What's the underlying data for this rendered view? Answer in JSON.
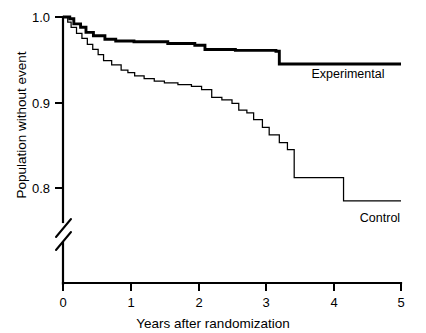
{
  "chart_data": {
    "type": "line",
    "subtype": "kaplan-meier-step",
    "title": "",
    "xlabel": "Years after randomization",
    "ylabel": "Population without event",
    "xlim": [
      0,
      5
    ],
    "ylim": [
      0.78,
      1.0
    ],
    "y_axis_break": true,
    "y_axis_break_note": "axis broken below 0.8",
    "grid": false,
    "legend_position": "inline-right-of-curve",
    "xticks": [
      0,
      1,
      2,
      3,
      4,
      5
    ],
    "xtick_labels": [
      "0",
      "1",
      "2",
      "3",
      "4",
      "5"
    ],
    "yticks": [
      0.8,
      0.9,
      1.0
    ],
    "ytick_labels": [
      "0.8",
      "0.9",
      "1.0"
    ],
    "series": [
      {
        "name": "Experimental",
        "label": "Experimental",
        "style": "bold",
        "points": [
          [
            0.0,
            1.0
          ],
          [
            0.1,
            0.998
          ],
          [
            0.16,
            0.992
          ],
          [
            0.26,
            0.988
          ],
          [
            0.34,
            0.982
          ],
          [
            0.45,
            0.978
          ],
          [
            0.62,
            0.974
          ],
          [
            0.78,
            0.972
          ],
          [
            1.05,
            0.971
          ],
          [
            1.55,
            0.969
          ],
          [
            1.95,
            0.967
          ],
          [
            2.1,
            0.962
          ],
          [
            2.55,
            0.961
          ],
          [
            3.15,
            0.96
          ],
          [
            3.2,
            0.945
          ],
          [
            5.0,
            0.945
          ]
        ]
      },
      {
        "name": "Control",
        "label": "Control",
        "style": "thin",
        "points": [
          [
            0.0,
            1.0
          ],
          [
            0.07,
            0.994
          ],
          [
            0.12,
            0.988
          ],
          [
            0.2,
            0.981
          ],
          [
            0.28,
            0.975
          ],
          [
            0.36,
            0.968
          ],
          [
            0.44,
            0.962
          ],
          [
            0.52,
            0.956
          ],
          [
            0.6,
            0.949
          ],
          [
            0.72,
            0.944
          ],
          [
            0.86,
            0.938
          ],
          [
            0.96,
            0.935
          ],
          [
            1.06,
            0.931
          ],
          [
            1.2,
            0.928
          ],
          [
            1.35,
            0.925
          ],
          [
            1.5,
            0.923
          ],
          [
            1.7,
            0.921
          ],
          [
            1.9,
            0.919
          ],
          [
            2.05,
            0.915
          ],
          [
            2.2,
            0.906
          ],
          [
            2.35,
            0.903
          ],
          [
            2.5,
            0.899
          ],
          [
            2.6,
            0.891
          ],
          [
            2.72,
            0.888
          ],
          [
            2.82,
            0.88
          ],
          [
            2.95,
            0.871
          ],
          [
            3.05,
            0.862
          ],
          [
            3.2,
            0.853
          ],
          [
            3.32,
            0.845
          ],
          [
            3.42,
            0.812
          ],
          [
            4.1,
            0.812
          ],
          [
            4.15,
            0.785
          ],
          [
            5.0,
            0.785
          ]
        ]
      }
    ]
  },
  "labels": {
    "y_axis_title": "Population without event",
    "x_axis_title": "Years after randomization",
    "experimental": "Experimental",
    "control": "Control",
    "ytick_1_0": "1.0",
    "ytick_0_9": "0.9",
    "ytick_0_8": "0.8",
    "xtick_0": "0",
    "xtick_1": "1",
    "xtick_2": "2",
    "xtick_3": "3",
    "xtick_4": "4",
    "xtick_5": "5"
  },
  "colors": {
    "ink": "#000000",
    "background": "#ffffff"
  }
}
